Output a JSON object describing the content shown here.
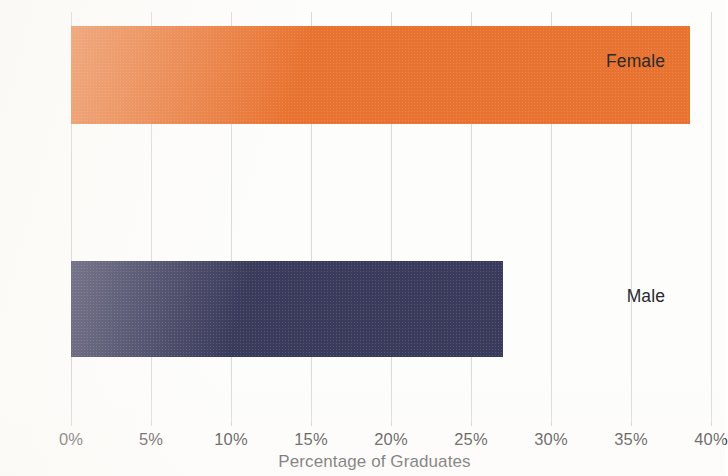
{
  "chart_data": {
    "type": "bar",
    "orientation": "horizontal",
    "title": "",
    "xlabel": "Percentage of Graduates",
    "ylabel": "",
    "categories": [
      "Male",
      "Female"
    ],
    "values": [
      27.0,
      38.7
    ],
    "value_format": "percent",
    "xlim": [
      0,
      40
    ],
    "xticks": [
      0,
      5,
      10,
      15,
      20,
      25,
      30,
      35,
      40
    ],
    "xticklabels": [
      "0%",
      "5%",
      "10%",
      "15%",
      "20%",
      "25%",
      "30%",
      "35%",
      "40%"
    ],
    "grid": "vertical",
    "legend": "none",
    "series": [
      {
        "name": "Percentage of Graduates",
        "points": [
          {
            "category": "Female",
            "value": 38.7,
            "color": "#e8722f"
          },
          {
            "category": "Male",
            "value": 27.0,
            "color": "#3a3a5c"
          }
        ]
      }
    ],
    "colors": {
      "female_bar": "#e8722f",
      "male_bar": "#3a3a5c",
      "gridline": "#d9d9d9",
      "text": "#2b2b2b",
      "background": "#fdfdfc"
    }
  },
  "axis": {
    "x_title": "Percentage of Graduates",
    "ticks": [
      {
        "label": "0%",
        "value": 0
      },
      {
        "label": "5%",
        "value": 5
      },
      {
        "label": "10%",
        "value": 10
      },
      {
        "label": "15%",
        "value": 15
      },
      {
        "label": "20%",
        "value": 20
      },
      {
        "label": "25%",
        "value": 25
      },
      {
        "label": "30%",
        "value": 30
      },
      {
        "label": "35%",
        "value": 35
      },
      {
        "label": "40%",
        "value": 40
      }
    ]
  },
  "categories": {
    "female": "Female",
    "male": "Male"
  }
}
